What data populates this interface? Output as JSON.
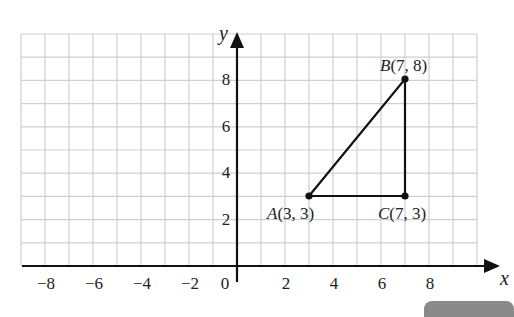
{
  "chart_data": {
    "type": "scatter",
    "title": "",
    "xlabel": "x",
    "ylabel": "y",
    "xlim": [
      -9,
      10
    ],
    "ylim": [
      0,
      10
    ],
    "grid": true,
    "x_ticks": [
      -8,
      -6,
      -4,
      -2,
      0,
      2,
      4,
      6,
      8
    ],
    "y_ticks": [
      2,
      4,
      6,
      8
    ],
    "x_tick_labels": [
      "−8",
      "−6",
      "−4",
      "−2",
      "0",
      "2",
      "4",
      "6",
      "8"
    ],
    "y_tick_labels": [
      "2",
      "4",
      "6",
      "8"
    ],
    "points": [
      {
        "name": "A",
        "x": 3,
        "y": 3,
        "label": "A(3, 3)"
      },
      {
        "name": "B",
        "x": 7,
        "y": 8,
        "label": "B(7, 8)"
      },
      {
        "name": "C",
        "x": 7,
        "y": 3,
        "label": "C(7, 3)"
      }
    ],
    "polygon": [
      "A",
      "B",
      "C"
    ]
  },
  "labels": {
    "x_axis": "x",
    "y_axis": "y",
    "point_a_name": "A",
    "point_a_coords": "(3, 3)",
    "point_b_name": "B",
    "point_b_coords": "(7, 8)",
    "point_c_name": "C",
    "point_c_coords": "(7, 3)",
    "origin": "0",
    "x_ticks": [
      "−8",
      "−6",
      "−4",
      "−2",
      "2",
      "4",
      "6",
      "8"
    ],
    "y_ticks": [
      "2",
      "4",
      "6",
      "8"
    ]
  }
}
